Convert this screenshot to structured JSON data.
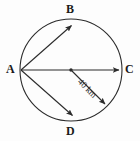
{
  "figure": {
    "type": "circle-geometry-diagram",
    "background_color": "#fdfdfd",
    "stroke_color": "#2b2b2b",
    "circle": {
      "center_x": 71,
      "center_y": 70,
      "radius": 51,
      "fill": "none"
    },
    "center_dot": {
      "label": "",
      "x": 71,
      "y": 70,
      "radius": 1.6
    },
    "points": [
      {
        "id": "A",
        "label": "A",
        "x": 20,
        "y": 70,
        "position": "left"
      },
      {
        "id": "B",
        "label": "B",
        "x": 73,
        "y": 23,
        "position": "top"
      },
      {
        "id": "C",
        "label": "C",
        "x": 122,
        "y": 70,
        "position": "right"
      },
      {
        "id": "D",
        "label": "D",
        "x": 74,
        "y": 118,
        "position": "bottom"
      }
    ],
    "arrows": [
      {
        "id": "A-to-B",
        "from": "A",
        "to": "B",
        "x1": 21,
        "y1": 70,
        "x2": 72,
        "y2": 25,
        "arrowhead": "end"
      },
      {
        "id": "A-to-C",
        "from": "A",
        "to": "C",
        "x1": 21,
        "y1": 70,
        "x2": 120,
        "y2": 70,
        "arrowhead": "end"
      },
      {
        "id": "A-to-D",
        "from": "A",
        "to": "D",
        "x1": 21,
        "y1": 70,
        "x2": 73,
        "y2": 116,
        "arrowhead": "end"
      },
      {
        "id": "center-to-edge",
        "from": "center",
        "to": "circle-edge",
        "x1": 72,
        "y1": 71,
        "x2": 106,
        "y2": 105,
        "arrowhead": "end"
      }
    ],
    "measurements": [
      {
        "id": "radius-measure",
        "value": "40 km",
        "quantity": 40,
        "unit": "km",
        "rotation_deg": 45,
        "applies_to": "center-to-edge"
      }
    ]
  }
}
